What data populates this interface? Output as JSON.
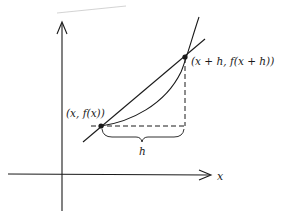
{
  "diagram": {
    "type": "secant-line-derivative",
    "colors": {
      "ink": "#1a1a1a",
      "faint": "#c8c8c8",
      "background": "#ffffff"
    },
    "axes": {
      "x_axis_label": "x",
      "y_axis_label": ""
    },
    "points": [
      {
        "label": "(x, f(x))"
      },
      {
        "label": "(x + h, f(x + h))"
      }
    ],
    "increment_label": "h"
  }
}
